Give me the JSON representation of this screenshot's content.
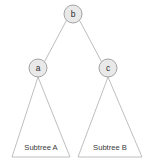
{
  "diagram": {
    "type": "binary-tree",
    "title": "",
    "background_color": "#ffffff",
    "colors": {
      "node_fill": "#e9e9e9",
      "node_stroke": "#9a9a9a",
      "edge_stroke": "#b0b0b0",
      "triangle_stroke": "#b4b4b4",
      "label_text": "#2b2b2b",
      "subtree_text": "#3a3a3a"
    },
    "nodes": [
      {
        "id": "b",
        "label": "b",
        "cx": 73,
        "cy": 14,
        "r": 9
      },
      {
        "id": "a",
        "label": "a",
        "cx": 38,
        "cy": 68,
        "r": 9
      },
      {
        "id": "c",
        "label": "c",
        "cx": 108,
        "cy": 68,
        "r": 9
      }
    ],
    "edges": [
      {
        "from": "b",
        "to": "a",
        "x1": 66.5,
        "y1": 20.3,
        "x2": 44.5,
        "y2": 61.7
      },
      {
        "from": "b",
        "to": "c",
        "x1": 79.5,
        "y1": 20.3,
        "x2": 101.5,
        "y2": 61.7
      }
    ],
    "subtrees": [
      {
        "id": "subtree-a",
        "label": "Subtree A",
        "apex_x": 38,
        "apex_y": 77,
        "base_left_x": 12,
        "base_right_x": 70,
        "base_y": 157,
        "label_x": 41,
        "label_y": 147
      },
      {
        "id": "subtree-b",
        "label": "Subtree B",
        "apex_x": 108,
        "apex_y": 77,
        "base_left_x": 78,
        "base_right_x": 142,
        "base_y": 157,
        "label_x": 110,
        "label_y": 147
      }
    ]
  }
}
